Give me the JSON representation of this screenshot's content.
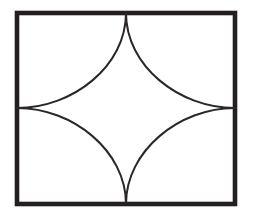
{
  "figure": {
    "title": "Square with four inward quarter-arcs forming a concave four-pointed star",
    "caption": "Square with four inward quarter-arcs forming a concave four-pointed star",
    "canvas": {
      "width": 254,
      "height": 221,
      "background_color": "#ffffff"
    },
    "colors": {
      "stroke": "#231f20",
      "border_stroke": "#231f20",
      "arc_stroke": "#2b2627",
      "fill": "none",
      "background": "#ffffff"
    },
    "rectangle": {
      "name": "outer-rectangle",
      "x": 17,
      "y": 13,
      "width": 218,
      "height": 191,
      "left": 17,
      "top": 13,
      "right": 235,
      "bottom": 204,
      "stroke_width": 4.6,
      "fill": "none"
    },
    "midpoints": {
      "top": {
        "x": 126,
        "y": 13
      },
      "right": {
        "x": 235,
        "y": 108
      },
      "bottom": {
        "x": 126,
        "y": 204
      },
      "left": {
        "x": 17,
        "y": 108
      }
    },
    "arcs": [
      {
        "name": "arc-top-left",
        "quadrant": "top-left",
        "from": "top-midpoint",
        "to": "left-midpoint",
        "bulge_toward": "top-left-corner",
        "stroke_width": 2.0
      },
      {
        "name": "arc-top-right",
        "quadrant": "top-right",
        "from": "top-midpoint",
        "to": "right-midpoint",
        "bulge_toward": "top-right-corner",
        "stroke_width": 2.0
      },
      {
        "name": "arc-bottom-right",
        "quadrant": "bottom-right",
        "from": "right-midpoint",
        "to": "bottom-midpoint",
        "bulge_toward": "bottom-right-corner",
        "stroke_width": 2.0
      },
      {
        "name": "arc-bottom-left",
        "quadrant": "bottom-left",
        "from": "bottom-midpoint",
        "to": "left-midpoint",
        "bulge_toward": "bottom-left-corner",
        "stroke_width": 2.0
      }
    ],
    "central_shape": {
      "name": "concave-star-region",
      "description": "Four-pointed concave star bounded by the four arcs",
      "fill": "none",
      "cusp_count": 4
    }
  }
}
